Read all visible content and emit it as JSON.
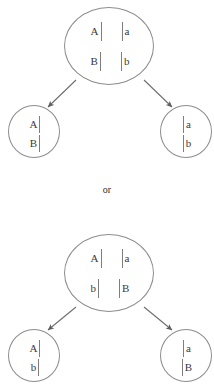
{
  "diagram": {
    "separator_label": "or",
    "stroke_color": "#8d8d8d",
    "chromatid_color": "#7e7e7e",
    "text_color": "#3a3a3a",
    "background_color": "#ffffff"
  },
  "outcome_one": {
    "parent": {
      "rows": [
        {
          "left_allele": "A",
          "right_allele": "a"
        },
        {
          "left_allele": "B",
          "right_allele": "b"
        }
      ]
    },
    "daughter_left": {
      "rows": [
        {
          "allele": "A"
        },
        {
          "allele": "B"
        }
      ]
    },
    "daughter_right": {
      "rows": [
        {
          "allele": "a"
        },
        {
          "allele": "b"
        }
      ]
    }
  },
  "outcome_two": {
    "parent": {
      "rows": [
        {
          "left_allele": "A",
          "right_allele": "a"
        },
        {
          "left_allele": "b",
          "right_allele": "B"
        }
      ]
    },
    "daughter_left": {
      "rows": [
        {
          "allele": "A"
        },
        {
          "allele": "b"
        }
      ]
    },
    "daughter_right": {
      "rows": [
        {
          "allele": "a"
        },
        {
          "allele": "B"
        }
      ]
    }
  }
}
